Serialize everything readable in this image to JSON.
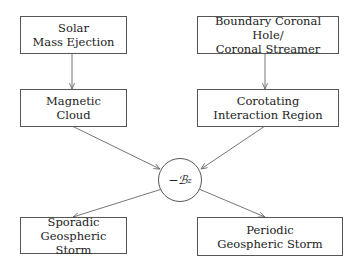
{
  "diagram": {
    "nodes": [
      {
        "id": "solar",
        "lines": [
          "Solar",
          "Mass Ejection"
        ]
      },
      {
        "id": "magnetic",
        "lines": [
          "Magnetic",
          "Cloud"
        ]
      },
      {
        "id": "boundary",
        "lines": [
          "Boundary Coronal Hole/",
          "Coronal Streamer"
        ]
      },
      {
        "id": "cir",
        "lines": [
          "Corotating",
          "Interaction Region"
        ]
      },
      {
        "id": "bz",
        "label": "−ℬ",
        "subscript": "z"
      },
      {
        "id": "sporadic",
        "lines": [
          "Sporadic",
          "Geospheric Storm"
        ]
      },
      {
        "id": "periodic",
        "lines": [
          "Periodic",
          "Geospheric Storm"
        ]
      }
    ],
    "edges": [
      {
        "from": "solar",
        "to": "magnetic"
      },
      {
        "from": "boundary",
        "to": "cir"
      },
      {
        "from": "magnetic",
        "to": "bz"
      },
      {
        "from": "cir",
        "to": "bz"
      },
      {
        "from": "bz",
        "to": "sporadic"
      },
      {
        "from": "bz",
        "to": "periodic"
      }
    ],
    "colors": {
      "stroke": "#555555",
      "arrow": "#666666"
    }
  }
}
